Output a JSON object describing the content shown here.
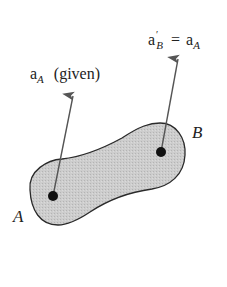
{
  "figure": {
    "width": 227,
    "height": 287,
    "colors": {
      "body_fill": "#c9c9c9",
      "body_stroke": "#2a2a2a",
      "arrow": "#555555",
      "point": "#111111",
      "text": "#222222"
    }
  },
  "labels": {
    "given_vec": {
      "base": "a",
      "sub": "A",
      "suffix": "(given)"
    },
    "equation": {
      "lhs_base": "a",
      "lhs_sup": "′",
      "lhs_sub": "B",
      "op": "=",
      "rhs_base": "a",
      "rhs_sub": "A"
    },
    "point_a": "A",
    "point_b": "B"
  },
  "geometry": {
    "point_a": [
      53,
      196
    ],
    "point_b": [
      161,
      152
    ],
    "arrow_a_tip": [
      73,
      94
    ],
    "arrow_b_tip": [
      178,
      57
    ]
  }
}
